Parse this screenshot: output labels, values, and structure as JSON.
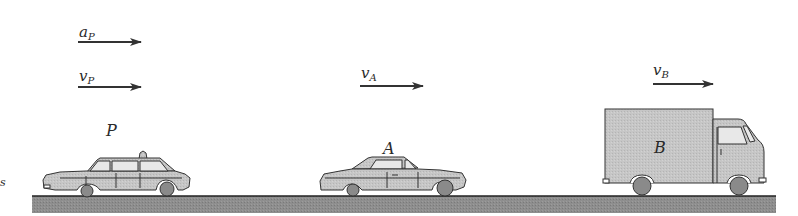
{
  "diagram": {
    "vectors": [
      {
        "id": "a_P",
        "symbol": "a",
        "subscript": "P",
        "meaning": "acceleration of P"
      },
      {
        "id": "v_P",
        "symbol": "v",
        "subscript": "P",
        "meaning": "velocity of P"
      },
      {
        "id": "v_A",
        "symbol": "v",
        "subscript": "A",
        "meaning": "velocity of A"
      },
      {
        "id": "v_B",
        "symbol": "v",
        "subscript": "B",
        "meaning": "velocity of B"
      }
    ],
    "vehicles": [
      {
        "id": "P",
        "label": "P",
        "type": "taxi"
      },
      {
        "id": "A",
        "label": "A",
        "type": "car"
      },
      {
        "id": "B",
        "label": "B",
        "type": "truck"
      }
    ],
    "colors": {
      "ground": "#8c8c8c",
      "body_fill": "#c4c4c4",
      "wheel_fill": "#8a8a8a",
      "outline": "#333333",
      "arrow": "#333333"
    }
  }
}
